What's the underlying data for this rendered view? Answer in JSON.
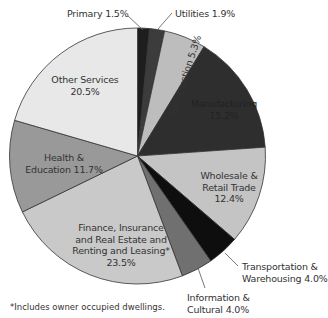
{
  "chart_data": {
    "type": "pie",
    "title": "",
    "start_angle_deg": 0,
    "direction": "clockwise",
    "slices": [
      {
        "label": "Primary",
        "value": 1.5,
        "value_label": "1.5%",
        "color": "#1e1e1e"
      },
      {
        "label": "Utilities",
        "value": 1.9,
        "value_label": "1.9%",
        "color": "#3c3c3c"
      },
      {
        "label": "Construction",
        "value": 5.3,
        "value_label": "5.3%",
        "color": "#bdbdbd"
      },
      {
        "label": "Manufacturing",
        "value": 15.2,
        "value_label": "15.2%",
        "color": "#2e2e2e"
      },
      {
        "label": "Wholesale & Retail Trade",
        "value": 12.4,
        "value_label": "12.4%",
        "color": "#c4c4c4"
      },
      {
        "label": "Transportation & Warehousing",
        "value": 4.0,
        "value_label": "4.0%",
        "color": "#0e0e0e"
      },
      {
        "label": "Information & Cultural",
        "value": 4.0,
        "value_label": "4.0%",
        "color": "#707070"
      },
      {
        "label": "Finance, Insurance and Real Estate and Renting and Leasing*",
        "value": 23.5,
        "value_label": "23.5%",
        "color": "#c9c9c9"
      },
      {
        "label": "Health & Education",
        "value": 11.7,
        "value_label": "11.7%",
        "color": "#999999"
      },
      {
        "label": "Other Services",
        "value": 20.5,
        "value_label": "20.5%",
        "color": "#e8e8e8"
      }
    ],
    "footnote": "*Includes owner occupied dwellings."
  },
  "labels": {
    "primary": "Primary 1.5%",
    "utilities": "Utilities 1.9%",
    "construction": "Construction 5.3%",
    "manufacturing_1": "Manufacturing",
    "manufacturing_2": "15.2%",
    "wholesale_1": "Wholesale &",
    "wholesale_2": "Retail Trade",
    "wholesale_3": "12.4%",
    "transport_1": "Transportation &",
    "transport_2": "Warehousing 4.0%",
    "info_1": "Information &",
    "info_2": "Cultural 4.0%",
    "finance_1": "Finance, Insurance",
    "finance_2": "and Real Estate and",
    "finance_3": "Renting and Leasing*",
    "finance_4": "23.5%",
    "health_1": "Health &",
    "health_2": "Education 11.7%",
    "other_1": "Other Services",
    "other_2": "20.5%"
  },
  "footnote": "*Includes owner occupied dwellings."
}
